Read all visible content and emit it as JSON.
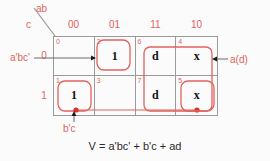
{
  "diagram": {
    "type": "karnaugh-map",
    "title_axis": {
      "top_label": "ab",
      "left_label": "c"
    },
    "column_headers": [
      "00",
      "01",
      "11",
      "10"
    ],
    "row_headers": [
      "0",
      "1"
    ],
    "cells": [
      {
        "index": "0",
        "value": ""
      },
      {
        "index": "2",
        "value": "1"
      },
      {
        "index": "6",
        "value": "d"
      },
      {
        "index": "4",
        "value": "x"
      },
      {
        "index": "1",
        "value": "1"
      },
      {
        "index": "3",
        "value": ""
      },
      {
        "index": "7",
        "value": "d"
      },
      {
        "index": "5",
        "value": "x"
      }
    ],
    "annotations": {
      "left": "a'bc'",
      "right": "a(d)",
      "bottom": "b'c"
    },
    "equation": "V = a'bc' + b'c + ad",
    "colors": {
      "accent_red": "#e0635c",
      "grid_gray": "#9a9a9a",
      "text_dark": "#2b2b2b",
      "background": "#fbfbfb"
    }
  }
}
